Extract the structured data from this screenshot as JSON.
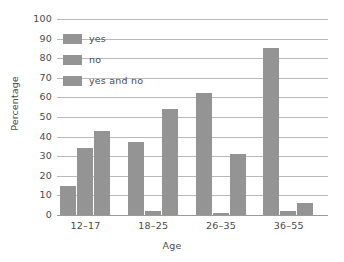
{
  "chart_data": {
    "type": "bar",
    "title": "",
    "subtitle": "",
    "xlabel": "Age",
    "ylabel": "Percentage",
    "categories": [
      "12–17",
      "18–25",
      "26–35",
      "36–55"
    ],
    "series": [
      {
        "name": "yes",
        "values": [
          15,
          37,
          62,
          85
        ]
      },
      {
        "name": "no",
        "values": [
          34,
          2,
          1,
          2
        ]
      },
      {
        "name": "yes and no",
        "values": [
          43,
          54,
          31,
          6
        ]
      }
    ],
    "ylim": [
      0,
      100
    ],
    "ytick_values": [
      0,
      10,
      20,
      30,
      40,
      50,
      60,
      70,
      80,
      90,
      100
    ],
    "ytick_labels": [
      "0",
      "10",
      "20",
      "30",
      "40",
      "50",
      "60",
      "70",
      "80",
      "90",
      "100"
    ],
    "grid": "horizontal",
    "legend_position": "top-left-inside",
    "bar_color": "#949494",
    "gridline_color": "#b9b9b9",
    "text_color": "#4a4a4a"
  },
  "legend": {
    "items": [
      {
        "label": "yes"
      },
      {
        "label": "no"
      },
      {
        "label": "yes and no"
      }
    ]
  },
  "axes": {
    "y_title": "Percentage",
    "x_title": "Age"
  }
}
